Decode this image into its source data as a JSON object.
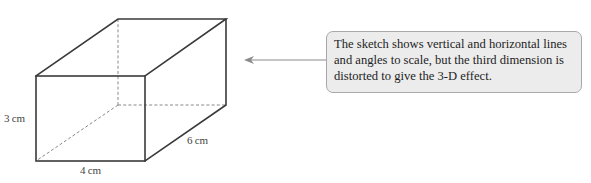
{
  "figure": {
    "title": "",
    "shape": "cuboid",
    "labels": {
      "height": "3 cm",
      "width": "4 cm",
      "depth": "6 cm"
    },
    "vertices": {
      "front_top_left": [
        36,
        76
      ],
      "front_top_right": [
        145,
        76
      ],
      "front_bottom_left": [
        36,
        161
      ],
      "front_bottom_right": [
        145,
        161
      ],
      "back_top_left": [
        118,
        19
      ],
      "back_top_right": [
        226,
        19
      ],
      "back_bottom_right": [
        226,
        105
      ],
      "back_bottom_left": [
        118,
        105
      ]
    },
    "colors": {
      "edge": "#3a3a3a",
      "hidden_edge": "#7a7a7a",
      "arrow": "#8a8a8a",
      "callout_fill": "#ececec",
      "callout_border": "#a8a8a8"
    }
  },
  "callout": {
    "text": "The sketch shows vertical and horizontal lines and angles to scale, but the third dimension is distorted to give the 3-D effect.",
    "lines": [
      "The sketch shows vertical and horizontal lines",
      "and angles to scale, but the third dimension is",
      "distorted to give the 3-D effect."
    ]
  }
}
